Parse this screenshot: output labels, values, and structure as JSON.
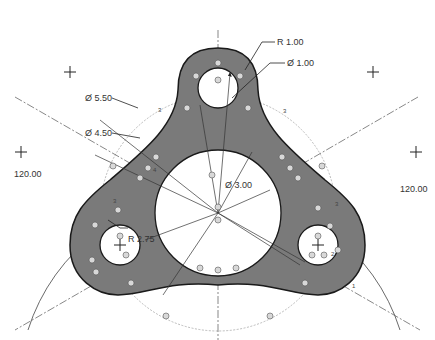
{
  "drawing": {
    "type": "CAD part drawing - three-lobed plate",
    "colors": {
      "part_fill": "#7a7a7a",
      "part_stroke": "#1a1a1a",
      "hole_fill": "#ffffff",
      "construction_line": "#555555",
      "dashed_circle": "#9a9a9a"
    },
    "dimensions": {
      "radius_lobe": "R 1.00",
      "dia_small_hole": "Ø 1.00",
      "dia_outer_dashed": "Ø 5.50",
      "dia_inner_dashed": "Ø 4.50",
      "dia_center_hole": "Ø 3.00",
      "radius_fillet": "R 2.75",
      "angle_left": "120.00",
      "angle_right": "120.00"
    },
    "markers": {
      "constraint_label_3": "3",
      "constraint_label_2": "2",
      "constraint_label_1": "1",
      "constraint_label_4": "4"
    }
  }
}
